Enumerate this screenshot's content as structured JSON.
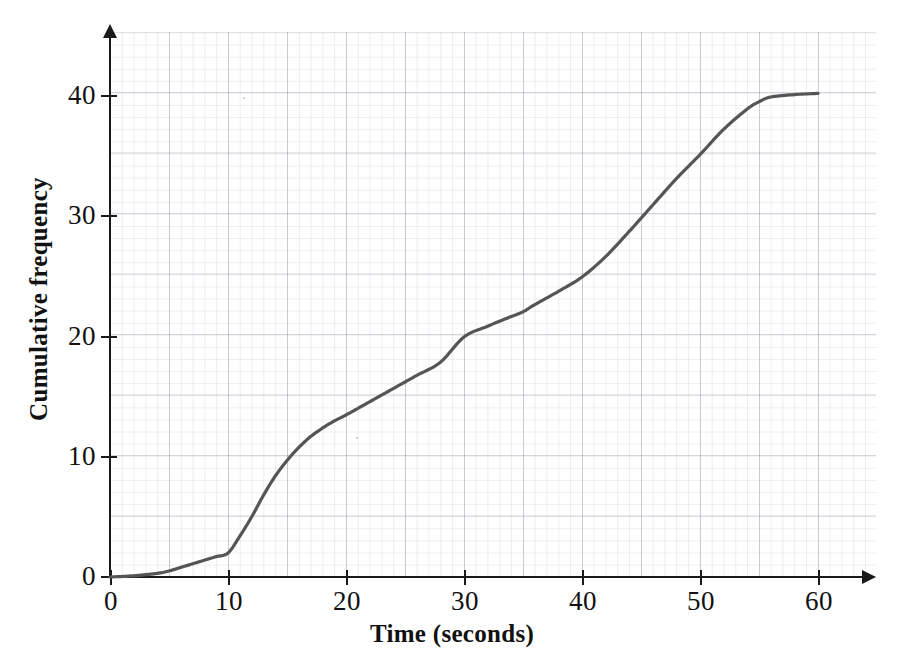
{
  "chart_data": {
    "type": "line",
    "title": "",
    "xlabel": "Time (seconds)",
    "ylabel": "Cumulative frequency",
    "xlim": [
      0,
      64
    ],
    "ylim": [
      0,
      45
    ],
    "xticks": [
      0,
      10,
      20,
      30,
      40,
      50,
      60
    ],
    "yticks": [
      0,
      10,
      20,
      30,
      40
    ],
    "grid": true,
    "grid_style": "graph paper, minor 1 unit, major 5 units",
    "legend": "none",
    "series": [
      {
        "name": "Cumulative frequency",
        "color": "#555555",
        "x": [
          0,
          2,
          4,
          5,
          6,
          7,
          8,
          9,
          10,
          11,
          12,
          13,
          14,
          15,
          16,
          17,
          18,
          19,
          20,
          22,
          24,
          26,
          28,
          30,
          32,
          34,
          35,
          36,
          38,
          40,
          42,
          44,
          46,
          48,
          50,
          52,
          54,
          55,
          56,
          58,
          60
        ],
        "y": [
          0,
          0.1,
          0.3,
          0.5,
          0.8,
          1.1,
          1.4,
          1.7,
          2.0,
          3.4,
          5.0,
          6.8,
          8.4,
          9.7,
          10.8,
          11.7,
          12.4,
          13.0,
          13.5,
          14.6,
          15.7,
          16.8,
          17.9,
          20.0,
          20.9,
          21.7,
          22.1,
          22.7,
          23.8,
          25.0,
          26.7,
          28.8,
          31.0,
          33.2,
          35.2,
          37.3,
          39.0,
          39.6,
          40.0,
          40.2,
          40.3
        ]
      }
    ],
    "read_off_values": {
      "at_10s": 2,
      "at_20s": 13.5,
      "at_30s": 20,
      "at_40s": 25,
      "at_50s": 35.2,
      "at_60s": 40.3,
      "total_frequency": 40
    }
  },
  "axis": {
    "x_tick_labels": [
      "0",
      "10",
      "20",
      "30",
      "40",
      "50",
      "60"
    ],
    "y_tick_labels": [
      "0",
      "10",
      "20",
      "30",
      "40"
    ],
    "x_title": "Time (seconds)",
    "y_title": "Cumulative frequency"
  },
  "colors": {
    "curve": "#555555",
    "axis": "#1a1a1a",
    "grid_major": "#8a8a9c",
    "grid_minor": "#a0a0b4",
    "background": "#ffffff"
  }
}
